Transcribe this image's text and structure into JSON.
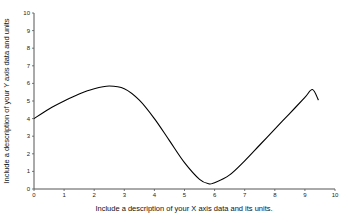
{
  "chart_data": {
    "type": "line",
    "title": "",
    "xlabel": "Include a description of your X axis data and its units.",
    "ylabel": "Include a description of your Y axis data and units",
    "xlim": [
      0,
      10
    ],
    "ylim": [
      0,
      10
    ],
    "xticks": [
      "0",
      "1",
      "2",
      "3",
      "4",
      "5",
      "6",
      "7",
      "8",
      "9",
      "10"
    ],
    "yticks": [
      "0",
      "1",
      "2",
      "3",
      "4",
      "5",
      "6",
      "7",
      "8",
      "9",
      "10"
    ],
    "grid": false,
    "legend": null,
    "series": [
      {
        "name": "curve",
        "color": "#000000",
        "x": [
          0,
          0.5,
          1,
          1.5,
          2,
          2.5,
          3,
          3.5,
          4,
          4.5,
          5,
          5.5,
          5.8,
          6,
          6.5,
          7,
          7.5,
          8,
          8.5,
          9,
          9.25,
          9.45
        ],
        "y": [
          4.0,
          4.55,
          5.0,
          5.4,
          5.7,
          5.85,
          5.7,
          5.05,
          4.0,
          2.75,
          1.5,
          0.55,
          0.3,
          0.35,
          0.8,
          1.6,
          2.5,
          3.4,
          4.3,
          5.2,
          5.65,
          5.05
        ]
      }
    ]
  }
}
